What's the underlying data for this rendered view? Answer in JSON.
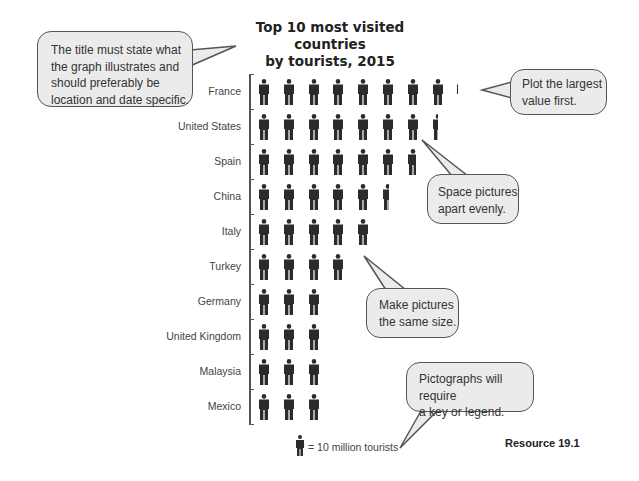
{
  "title": {
    "line1": "Top 10 most visited countries",
    "line2": "by tourists, 2015"
  },
  "legend": {
    "icon": "person-icon",
    "text": "= 10 million tourists",
    "unit_value": 10
  },
  "callouts": {
    "title_tip": [
      "The title must state what",
      "the graph illustrates and",
      "should preferably be",
      "location and date specific."
    ],
    "largest_first": [
      "Plot the largest",
      "value first."
    ],
    "spacing": [
      "Space pictures",
      "apart evenly."
    ],
    "size": [
      "Make pictures",
      "the same size."
    ],
    "key": [
      "Pictographs will require",
      "a key or legend."
    ]
  },
  "footer": {
    "resource": "Resource 19.1"
  },
  "colors": {
    "icon": "#2b2b2b",
    "bubble_fill": "#ebebeb",
    "bubble_border": "#555555"
  },
  "chart_data": {
    "type": "pictograph",
    "title": "Top 10 most visited countries by tourists, 2015",
    "xlabel": "",
    "ylabel": "",
    "unit": "million tourists",
    "icon_value": 10,
    "categories": [
      "France",
      "United States",
      "Spain",
      "China",
      "Italy",
      "Turkey",
      "Germany",
      "United Kingdom",
      "Malaysia",
      "Mexico"
    ],
    "icons": [
      8.1,
      7.5,
      6.8,
      5.6,
      5,
      4,
      3,
      3,
      3,
      3
    ],
    "values": [
      81,
      75,
      68,
      56,
      50,
      40,
      30,
      30,
      30,
      30
    ],
    "legend": "one icon = 10 million tourists",
    "grid": false
  }
}
